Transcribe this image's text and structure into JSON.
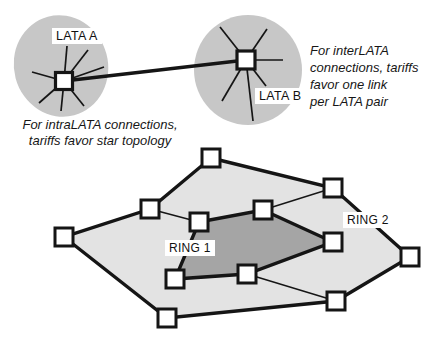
{
  "labels": {
    "lata_a": "LATA A",
    "lata_b": "LATA B",
    "ring1": "RING 1",
    "ring2": "RING 2"
  },
  "captions": {
    "intralata": [
      "For intraLATA connections,",
      "tariffs favor star topology"
    ],
    "interlata": [
      "For interLATA",
      "connections, tariffs",
      "favor one link",
      "per LATA pair"
    ]
  },
  "colors": {
    "line": "#151515",
    "node_fill": "#ffffff",
    "lata_blob": "#c7c7c7",
    "ring2_fill": "#e3e3e3",
    "ring1_fill": "#a5a5a5",
    "label_bg": "#ffffff",
    "text": "#161616"
  },
  "diagram": {
    "lata_a": {
      "blob": {
        "cx": 61,
        "cy": 66,
        "rx": 47,
        "ry": 51,
        "rotate": -15
      },
      "hub": {
        "x": 64,
        "y": 81,
        "size": 17
      },
      "spokes": [
        [
          67,
          46
        ],
        [
          88,
          50
        ],
        [
          104,
          67
        ],
        [
          32,
          72
        ],
        [
          39,
          103
        ],
        [
          61,
          111
        ],
        [
          84,
          106
        ]
      ]
    },
    "lata_b": {
      "blob": {
        "cx": 248,
        "cy": 70,
        "rx": 54,
        "ry": 55,
        "rotate": 0
      },
      "hub": {
        "x": 246,
        "y": 60,
        "size": 18
      },
      "spokes": [
        [
          220,
          27
        ],
        [
          267,
          29
        ],
        [
          283,
          60
        ],
        [
          266,
          86
        ],
        [
          222,
          101
        ],
        [
          253,
          121
        ]
      ]
    },
    "interlata_link": {
      "x1": 64,
      "y1": 81,
      "x2": 246,
      "y2": 60
    },
    "ring2_nodes": [
      [
        211,
        158
      ],
      [
        333,
        188
      ],
      [
        410,
        257
      ],
      [
        336,
        301
      ],
      [
        167,
        318
      ],
      [
        64,
        237
      ],
      [
        150,
        209
      ]
    ],
    "ring1_nodes": [
      [
        199,
        222
      ],
      [
        263,
        210
      ],
      [
        333,
        242
      ],
      [
        247,
        274
      ],
      [
        175,
        279
      ]
    ],
    "inter_ring_links": [
      {
        "outer": 6,
        "inner": 0
      },
      {
        "outer": 1,
        "inner": 1
      },
      {
        "outer": 3,
        "inner": 3
      }
    ],
    "node_size": 18
  }
}
